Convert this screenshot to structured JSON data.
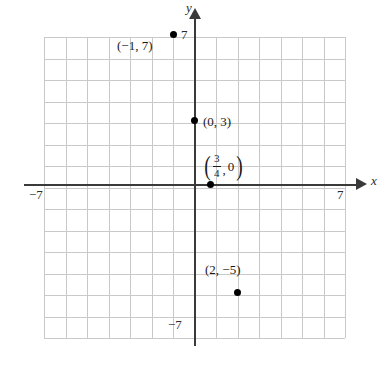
{
  "figure": {
    "type": "coordinate-plane",
    "background_color": "#ffffff",
    "grid_color": "#c9c9c9",
    "axis_color": "#3a3a3a",
    "point_color": "#000000"
  },
  "axes": {
    "x": {
      "name": "x",
      "min_label": "−7",
      "max_label": "7",
      "range": [
        -7,
        7
      ]
    },
    "y": {
      "name": "y",
      "min_label": "−7",
      "max_label": "7",
      "range": [
        -7,
        7
      ]
    }
  },
  "chart_data": {
    "type": "scatter",
    "title": "",
    "xlabel": "x",
    "ylabel": "y",
    "xlim": [
      -7,
      7
    ],
    "ylim": [
      -7,
      7
    ],
    "grid": true,
    "legend": "none",
    "points": [
      {
        "id": "p1",
        "label": "(−1, 7)",
        "x": -1,
        "y": 7
      },
      {
        "id": "p2",
        "label": "(0, 3)",
        "x": 0,
        "y": 3
      },
      {
        "id": "p3",
        "label": "(3/4, 0)",
        "x": 0.75,
        "y": 0,
        "label_parts": {
          "open": "(",
          "numerator": "3",
          "denominator": "4",
          "comma": ",",
          "second": "0",
          "close": ")"
        }
      },
      {
        "id": "p4",
        "label": "(2, −5)",
        "x": 2,
        "y": -5
      }
    ]
  }
}
